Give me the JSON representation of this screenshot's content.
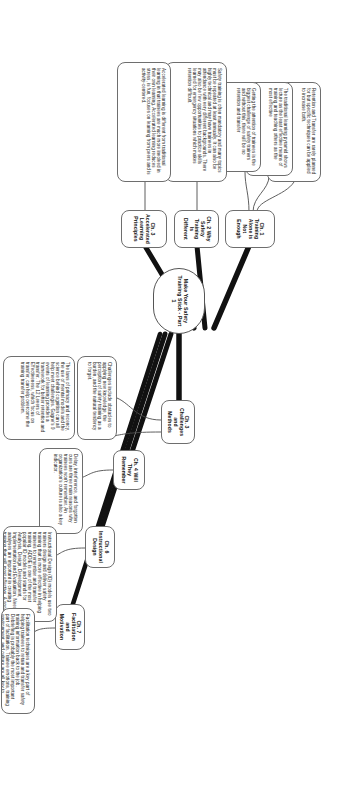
{
  "diagram": {
    "type": "mindmap",
    "orientation": "rotated-90-clockwise",
    "root": {
      "label": "Make Your Safety Training Stick - Part 1"
    },
    "branches": [
      {
        "id": "ch1",
        "label": "Ch. 1 Training Alone is Not Enough",
        "notes": [
          "Retention and Transfer are rarely planned for but specific techniques can be applied to increase both.",
          "The traditional learning pyramid shows lecture as the least effective means of training and teaching others as the most effective",
          "Getting the attention of trainees is the biggest challenge of safety trainers and without this, there will be no retention and transfer"
        ]
      },
      {
        "id": "ch2",
        "label": "Ch. 2 Why Safety Training Is Different",
        "notes": [
          "Safety training is often mandatory and many topics must be repeated at least annually.  It can also be highly technical and may have trainees in attendance with very different backgrounds. There may also be few opportunities to practice skills learned for emergency situations which makes retention difficult."
        ]
      },
      {
        "id": "ch3",
        "label": "Ch. 3 Accelerated Learning Principles",
        "notes": [
          "Accelerated learning is different from traditional learning in that trainees are much more involved in their own learning. Accelerated learning reduces stress, is fun, focuses on learning from peers and is activity-centered."
        ]
      },
      {
        "id": "ch4",
        "label": "Ch. 3 Challenges and Methods",
        "notes": [
          "Challenges include obstacles to applying new knowledge, the perception of safety training as a burden, and the natural tendency to forget.",
          "The laws of primacy and recency, the use of mental models and the science behind cognition can all help meet challenges. Gagne's 9 events of learning provides a framework for better retention and transfer. The 12 Levers of Effectiveness, which focus on transfer, can help overcome the training transfer problem."
        ]
      },
      {
        "id": "ch5",
        "label": "Ch. 4 Will They Remember",
        "notes": [
          "Delay, interference, and forgotten cues are three main reasons why trainees won't remember. An organization's culture is also a key indicator."
        ]
      },
      {
        "id": "ch6",
        "label": "Ch. 6 Instructional Design",
        "notes": [
          "Instructional Design (ID) models use two trainers design and deliver safety training that is more effective in helping trainees to remember and transfer training. ADDIE is one of the most popular ID models and stands for Analysis, Design, Development, Implementation and Evaluation. Needs analyses are important in creating training that will most effective. A good needs analysis should look at the current situation, the desired situation and the cause of the gap between the two."
        ]
      },
      {
        "id": "ch7",
        "label": "Ch. 7 Facilitation and Motivation",
        "notes": [
          "Facilitation techniques are a key part of helping trainees to retain and transfer safety training information back to the job. Debriefing is probably the most important part of facilitation. Trainee emotions, training environment, and culture are all key to increasing trainees' motivation to path attention which is the first step of retention and transfer."
        ]
      }
    ]
  }
}
